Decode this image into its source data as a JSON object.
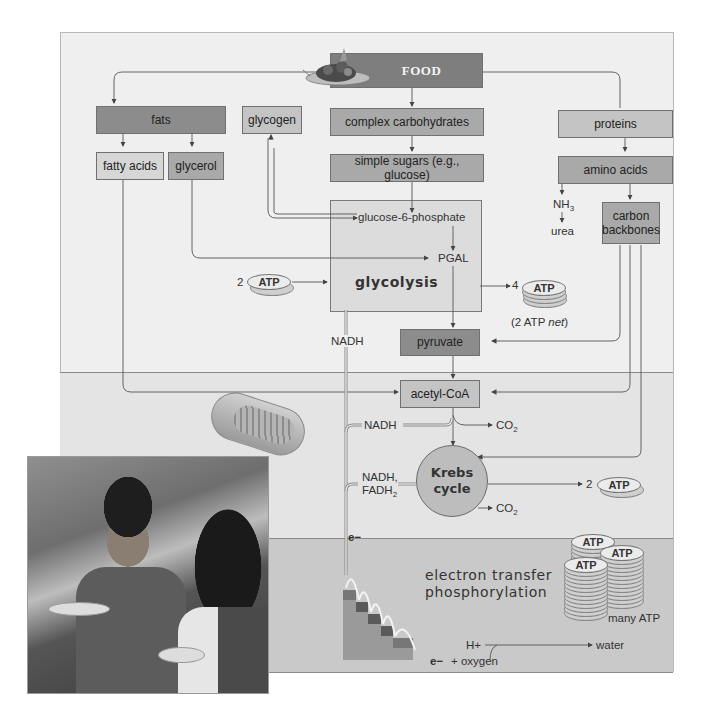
{
  "diagram": {
    "title_box": "FOOD",
    "nodes": {
      "fats": "fats",
      "glycogen": "glycogen",
      "complex_carbs": "complex carbohydrates",
      "proteins": "proteins",
      "fatty_acids": "fatty acids",
      "glycerol": "glycerol",
      "simple_sugars": "simple sugars (e.g., glucose)",
      "amino_acids": "amino acids",
      "nh3": "NH",
      "nh3_sub": "3",
      "urea": "urea",
      "carbon_backbones": "carbon backbones",
      "glucose6p": "glucose-6-phosphate",
      "pgal": "PGAL",
      "glycolysis": "glycolysis",
      "pyruvate": "pyruvate",
      "acetyl_coa": "acetyl-CoA",
      "krebs_line1": "Krebs",
      "krebs_line2": "cycle",
      "etp_line1": "electron transfer",
      "etp_line2": "phosphorylation"
    },
    "labels": {
      "atp_in_count": "2",
      "atp_out_count": "4",
      "atp_net_prefix": "(2 ATP ",
      "atp_net_italic": "net",
      "atp_net_suffix": ")",
      "nadh_glycolysis": "NADH",
      "nadh_acetyl": "NADH",
      "co2": "CO",
      "co2_sub": "2",
      "nadh_krebs": "NADH,",
      "fadh2": "FADH",
      "fadh2_sub": "2",
      "krebs_atp_count": "2",
      "electron": "e−",
      "electron_oxygen": "e−",
      "plus_oxygen": "+ oxygen",
      "hplus": "H+",
      "water": "water",
      "many_atp": "many ATP",
      "atp": "ATP"
    }
  },
  "colors": {
    "panel_bg": "#efefef",
    "mitochondrion_band": "#e4e4e4",
    "etp_band": "#c9c9c9",
    "box_dark": "#8c8c8c",
    "box_mid": "#a9a9a9",
    "box_light": "#c4c4c4",
    "line": "#555555"
  }
}
